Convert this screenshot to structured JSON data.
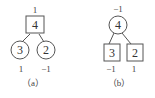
{
  "diagrams": [
    {
      "caption": "（a）",
      "root": {
        "value": "4",
        "shape": "square",
        "label": "1"
      },
      "children": [
        {
          "value": "3",
          "shape": "circle",
          "label": "1"
        },
        {
          "value": "2",
          "shape": "circle",
          "label": "−1"
        }
      ]
    },
    {
      "caption": "（b）",
      "root": {
        "value": "4",
        "shape": "circle",
        "label": "−1"
      },
      "children": [
        {
          "value": "3",
          "shape": "square",
          "label": "−1"
        },
        {
          "value": "2",
          "shape": "square",
          "label": "1"
        }
      ]
    }
  ],
  "colors": {
    "stroke": "#555555",
    "text": "#333333",
    "background": "#ffffff"
  }
}
